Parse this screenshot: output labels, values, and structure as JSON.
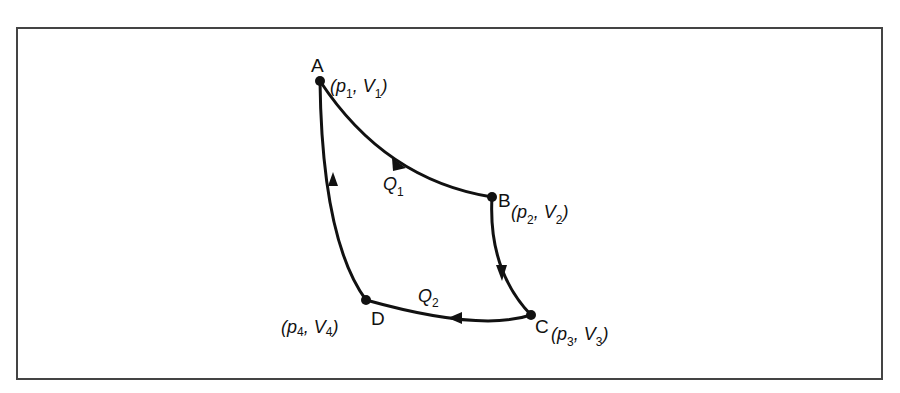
{
  "diagram": {
    "type": "thermodynamic-cycle",
    "points": [
      {
        "id": "A",
        "label": "A",
        "p": "p",
        "p_sub": "1",
        "v": "V",
        "v_sub": "1"
      },
      {
        "id": "B",
        "label": "B",
        "p": "p",
        "p_sub": "2",
        "v": "V",
        "v_sub": "2"
      },
      {
        "id": "C",
        "label": "C",
        "p": "p",
        "p_sub": "3",
        "v": "V",
        "v_sub": "3"
      },
      {
        "id": "D",
        "label": "D",
        "p": "p",
        "p_sub": "4",
        "v": "V",
        "v_sub": "4"
      }
    ],
    "heat": [
      {
        "label": "Q",
        "sub": "1",
        "path": "A→B"
      },
      {
        "label": "Q",
        "sub": "2",
        "path": "C→D"
      }
    ],
    "paths": [
      "A→B",
      "B→C",
      "C→D",
      "D→A"
    ],
    "colors": {
      "line": "#111111",
      "frame": "#444444",
      "background": "#ffffff"
    }
  }
}
